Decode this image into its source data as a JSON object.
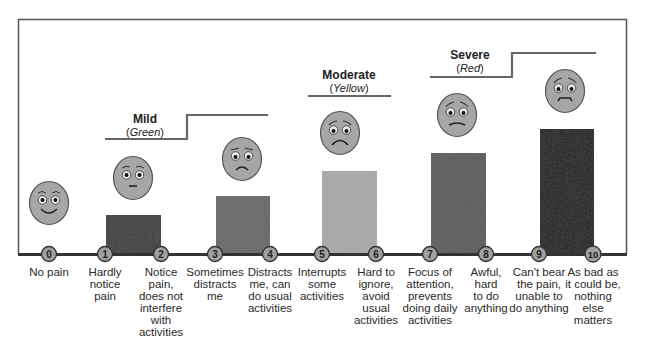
{
  "categories": [
    {
      "name": "Mild",
      "color_label": "Green"
    },
    {
      "name": "Moderate",
      "color_label": "Yellow"
    },
    {
      "name": "Severe",
      "color_label": "Red"
    }
  ],
  "scale": [
    {
      "value": "0",
      "lines": [
        "No pain"
      ]
    },
    {
      "value": "1",
      "lines": [
        "Hardly",
        "notice",
        "pain"
      ]
    },
    {
      "value": "2",
      "lines": [
        "Notice",
        "pain,",
        "does not",
        "interfere",
        "with",
        "activities"
      ]
    },
    {
      "value": "3",
      "lines": [
        "Sometimes",
        "distracts",
        "me"
      ]
    },
    {
      "value": "4",
      "lines": [
        "Distracts",
        "me, can",
        "do usual",
        "activities"
      ]
    },
    {
      "value": "5",
      "lines": [
        "Interrupts",
        "some",
        "activities"
      ]
    },
    {
      "value": "6",
      "lines": [
        "Hard to",
        "ignore,",
        "avoid",
        "usual",
        "activities"
      ]
    },
    {
      "value": "7",
      "lines": [
        "Focus of",
        "attention,",
        "prevents",
        "doing daily",
        "activities"
      ]
    },
    {
      "value": "8",
      "lines": [
        "Awful,",
        "hard",
        "to do",
        "anything"
      ]
    },
    {
      "value": "9",
      "lines": [
        "Can't bear",
        "the pain,",
        "unable to",
        "do anything"
      ]
    },
    {
      "value": "10",
      "lines": [
        "As bad as",
        "it could be,",
        "nothing",
        "else",
        "matters"
      ]
    }
  ],
  "faces": [
    {
      "expression": "smile-face-icon"
    },
    {
      "expression": "neutral-face-icon"
    },
    {
      "expression": "slight-frown-face-icon"
    },
    {
      "expression": "frown-face-icon"
    },
    {
      "expression": "grimace-face-icon"
    },
    {
      "expression": "distressed-face-icon"
    }
  ],
  "bars": [
    {
      "span": "1-2",
      "color": "#3c3c3c"
    },
    {
      "span": "3-4",
      "color": "#676767"
    },
    {
      "span": "5-6",
      "color": "#a9a9a9"
    },
    {
      "span": "7-8",
      "color": "#5c5c5c"
    },
    {
      "span": "9-10",
      "color": "#1c1c1c"
    }
  ],
  "colors": {
    "face_fill": "#a6a6a6",
    "face_stroke": "#555555",
    "frame": "#555555",
    "baseline": "#333333",
    "marker_fill": "#a0a0a0"
  }
}
